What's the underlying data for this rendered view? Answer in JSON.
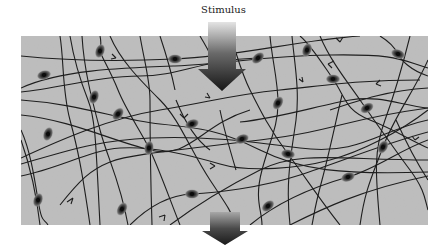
{
  "diagram": {
    "title_label": "Stimulus",
    "panel": {
      "x": 21,
      "y": 36,
      "width": 407,
      "height": 189,
      "fill": "#bdbdbd"
    },
    "arrows": {
      "input": {
        "x_center": 222,
        "top": 22,
        "bottom": 91,
        "shaft_width": 30,
        "head_width": 48,
        "head_height": 22
      },
      "output": {
        "x_center": 225,
        "top": 212,
        "bottom": 245,
        "shaft_width": 30,
        "head_width": 46,
        "head_height": 16
      }
    },
    "neurons": [
      {
        "x": 100,
        "y": 51,
        "a": -70
      },
      {
        "x": 175,
        "y": 59,
        "a": 0
      },
      {
        "x": 44,
        "y": 75,
        "a": -15
      },
      {
        "x": 94,
        "y": 97,
        "a": -70
      },
      {
        "x": 118,
        "y": 114,
        "a": -50
      },
      {
        "x": 192,
        "y": 124,
        "a": -20
      },
      {
        "x": 48,
        "y": 134,
        "a": -70
      },
      {
        "x": 258,
        "y": 58,
        "a": -40
      },
      {
        "x": 307,
        "y": 50,
        "a": -70
      },
      {
        "x": 398,
        "y": 54,
        "a": 20
      },
      {
        "x": 333,
        "y": 79,
        "a": 0
      },
      {
        "x": 278,
        "y": 103,
        "a": -60
      },
      {
        "x": 367,
        "y": 108,
        "a": -30
      },
      {
        "x": 149,
        "y": 148,
        "a": -80
      },
      {
        "x": 192,
        "y": 194,
        "a": 0
      },
      {
        "x": 38,
        "y": 200,
        "a": -70
      },
      {
        "x": 122,
        "y": 209,
        "a": -60
      },
      {
        "x": 242,
        "y": 139,
        "a": -20
      },
      {
        "x": 288,
        "y": 154,
        "a": 10
      },
      {
        "x": 383,
        "y": 147,
        "a": -60
      },
      {
        "x": 348,
        "y": 177,
        "a": -20
      },
      {
        "x": 268,
        "y": 206,
        "a": -40
      }
    ],
    "colors": {
      "fiber": "#1e1e1e",
      "soma": "#3a3a3a",
      "nucleus": "#0c0c0c",
      "arrow_dark": "#1a1a1a",
      "arrow_light": "#d8d8d8"
    }
  }
}
